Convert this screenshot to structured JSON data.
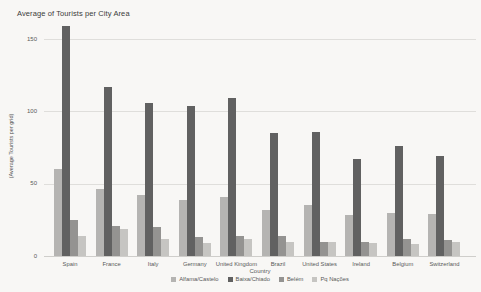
{
  "title": "Average of Tourists per City Area",
  "chart_data": {
    "type": "bar",
    "title": "Average of Tourists per City Area",
    "xlabel": "Country",
    "ylabel": "(Average Tourists per grid)",
    "ylim": [
      0,
      165
    ],
    "yticks": [
      0,
      50,
      100,
      150
    ],
    "grid": true,
    "legend_position": "bottom",
    "categories": [
      "Spain",
      "France",
      "Italy",
      "Germany",
      "United Kingdom",
      "Brazil",
      "United States",
      "Ireland",
      "Belgium",
      "Switzerland"
    ],
    "series": [
      {
        "name": "Alfama/Castelo",
        "color": "#b5b4b2",
        "values": [
          60,
          46,
          42,
          39,
          41,
          32,
          35,
          28,
          30,
          29
        ]
      },
      {
        "name": "Baixa/Chiado",
        "color": "#616161",
        "values": [
          159,
          117,
          106,
          104,
          109,
          85,
          86,
          67,
          76,
          69
        ]
      },
      {
        "name": "Belém",
        "color": "#949391",
        "values": [
          25,
          21,
          20,
          13,
          14,
          14,
          10,
          10,
          12,
          11
        ]
      },
      {
        "name": "Pq Nações",
        "color": "#c6c5c2",
        "values": [
          14,
          19,
          12,
          9,
          12,
          10,
          10,
          9,
          8,
          10
        ]
      }
    ]
  }
}
